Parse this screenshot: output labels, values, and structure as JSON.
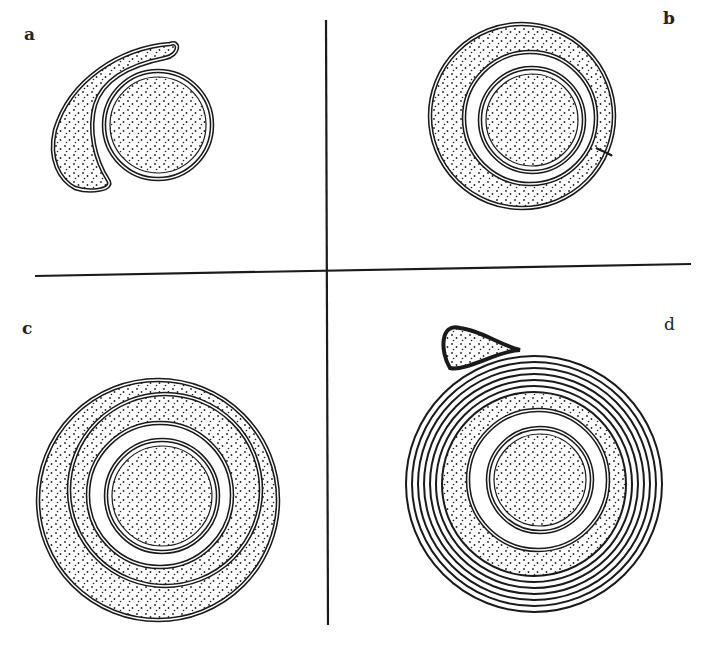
{
  "figure": {
    "panels": [
      {
        "id": "a",
        "label": "a",
        "description": "Glial process beginning to wrap around axon"
      },
      {
        "id": "b",
        "label": "b",
        "description": "Process encircles axon once, forming mesaxon"
      },
      {
        "id": "c",
        "label": "c",
        "description": "Process spirals around axon twice"
      },
      {
        "id": "d",
        "label": "d",
        "description": "Multiple compacted lamellae (myelin sheath) with cell body at top"
      }
    ],
    "caption_fragment": "",
    "colors": {
      "ink": "#1a1a1a",
      "paper": "#ffffff"
    }
  }
}
